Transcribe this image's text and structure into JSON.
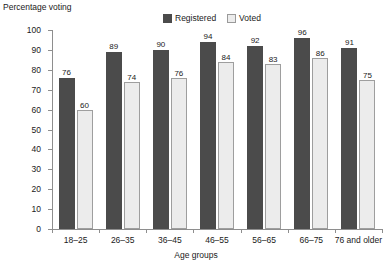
{
  "chart_data": {
    "type": "bar",
    "title": "",
    "xlabel": "Age groups",
    "ylabel": "Percentage voting",
    "ylim": [
      0,
      100
    ],
    "ytick_step": 10,
    "yticks": [
      0,
      10,
      20,
      30,
      40,
      50,
      60,
      70,
      80,
      90,
      100
    ],
    "grid": false,
    "legend_position": "top-center",
    "categories": [
      "18–25",
      "26–35",
      "36–45",
      "46–55",
      "56–65",
      "66–75",
      "76 and older"
    ],
    "series": [
      {
        "name": "Registered",
        "color": "#4b4b4b",
        "values": [
          76,
          89,
          90,
          94,
          92,
          96,
          91
        ]
      },
      {
        "name": "Voted",
        "color": "#ececec",
        "values": [
          60,
          74,
          76,
          84,
          83,
          86,
          75
        ]
      }
    ]
  }
}
